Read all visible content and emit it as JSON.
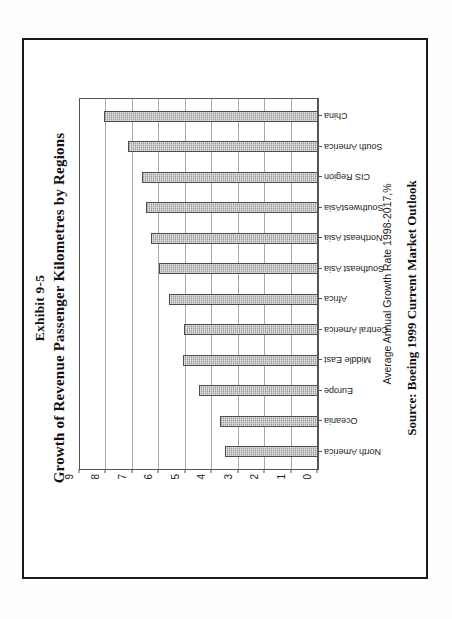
{
  "document": {
    "exhibit_label": "Exhibit 9-5",
    "title": "Growth of Revenue Passenger Kilometres by Regions",
    "source_note": "Source: Boeing 1999 Current Market Outlook",
    "page_border_color": "#1a1a1a",
    "background_color": "#ffffff"
  },
  "chart_data": {
    "type": "bar",
    "title": "Growth of Revenue Passenger Kilometres by Regions",
    "subtitle": "Exhibit 9-5",
    "orientation": "vertical",
    "rotation": "figure is printed rotated 90 degrees counter-clockwise on the page",
    "categories": [
      "North America",
      "Oceania",
      "Europe",
      "Middle East",
      "Central America",
      "Africa",
      "Southeast Asia",
      "Northeast Asia",
      "SouthwestAsia",
      "CIS Region",
      "South America",
      "China"
    ],
    "values": [
      3.5,
      3.7,
      4.5,
      5.1,
      5.05,
      5.65,
      6.0,
      6.3,
      6.5,
      6.65,
      7.2,
      8.1
    ],
    "xlabel": "",
    "ylabel": "Average Annual Growth Rate 1998-2017,%",
    "ylim": [
      0,
      9
    ],
    "ytick_labels": [
      "0",
      "1",
      "2",
      "3",
      "4",
      "5",
      "6",
      "7",
      "8",
      "9"
    ],
    "yticks": [
      0,
      1,
      2,
      3,
      4,
      5,
      6,
      7,
      8,
      9
    ],
    "grid": true,
    "grid_axis": "y",
    "legend": false,
    "bar_color": "#9a9a9a",
    "bar_edge_color": "#4d4d4d",
    "bar_pattern": "fine dotted / hatched fill"
  },
  "axis": {
    "value_axis_title": "Average Annual Growth Rate 1998-2017,%"
  },
  "icons": {}
}
